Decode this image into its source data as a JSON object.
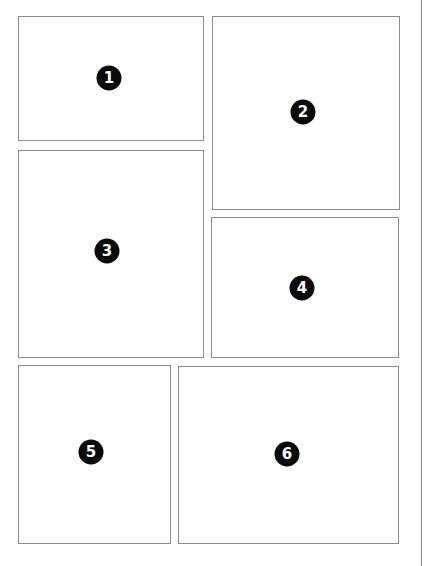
{
  "layout": {
    "title": "Comic page panel layout",
    "page_edge_color": "#8a8a8a",
    "panel_border_color": "#8c8c8c",
    "badge_color": "#0a0a0a",
    "badge_text_color": "#ffffff"
  },
  "panels": [
    {
      "number": "1",
      "x": 18,
      "y": 16,
      "w": 186,
      "h": 125,
      "badge_x": 109,
      "badge_y": 78
    },
    {
      "number": "2",
      "x": 212,
      "y": 16,
      "w": 188,
      "h": 194,
      "badge_x": 303,
      "badge_y": 112
    },
    {
      "number": "3",
      "x": 18,
      "y": 150,
      "w": 186,
      "h": 208,
      "badge_x": 107,
      "badge_y": 251
    },
    {
      "number": "4",
      "x": 211,
      "y": 217,
      "w": 188,
      "h": 141,
      "badge_x": 302,
      "badge_y": 288
    },
    {
      "number": "5",
      "x": 18,
      "y": 365,
      "w": 153,
      "h": 179,
      "badge_x": 91,
      "badge_y": 452
    },
    {
      "number": "6",
      "x": 178,
      "y": 366,
      "w": 221,
      "h": 178,
      "badge_x": 287,
      "badge_y": 454
    }
  ]
}
